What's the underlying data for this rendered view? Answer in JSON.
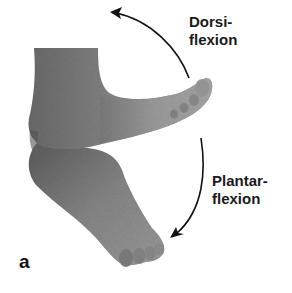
{
  "figure": {
    "panel_letter": "a",
    "labels": {
      "dorsiflexion_line1": "Dorsi-",
      "dorsiflexion_line2": "flexion",
      "plantarflexion_line1": "Plantar-",
      "plantarflexion_line2": "flexion"
    },
    "arrows": {
      "dorsiflexion": "arrow-up-left",
      "plantarflexion": "arrow-down-left"
    },
    "colors": {
      "background": "#ffffff",
      "foot_dark": "#5e5e5e",
      "foot_mid": "#8a8a8a",
      "foot_light": "#a8a8a8",
      "arrow": "#111111",
      "text": "#1a1a1a"
    }
  }
}
